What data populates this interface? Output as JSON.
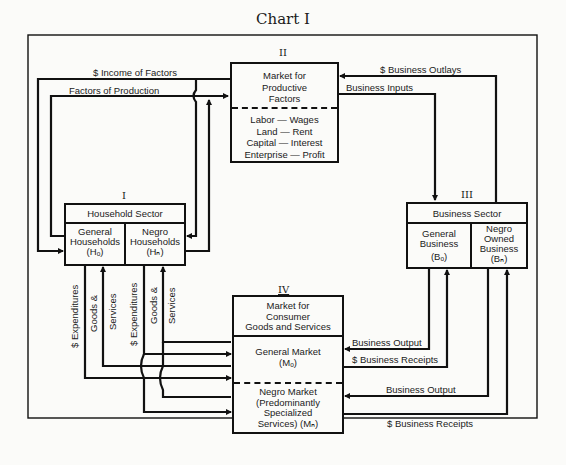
{
  "title": "Chart I",
  "sectors": {
    "market_productive": {
      "numeral": "II",
      "title_lines": [
        "Market for",
        "Productive",
        "Factors"
      ],
      "factor_rows": [
        "Labor — Wages",
        "Land — Rent",
        "Capital — Interest",
        "Enterprise — Profit"
      ]
    },
    "household": {
      "numeral": "I",
      "title": "Household Sector",
      "general": [
        "General",
        "Households",
        "(Hₒ)"
      ],
      "negro": [
        "Negro",
        "Households",
        "(Hₙ)"
      ]
    },
    "business": {
      "numeral": "III",
      "title": "Business Sector",
      "general": [
        "General",
        "Business",
        "(Bₒ)"
      ],
      "negro": [
        "Negro",
        "Owned",
        "Business",
        "(Bₙ)"
      ]
    },
    "market_consumer": {
      "numeral": "IV",
      "title_lines": [
        "Market for",
        "Consumer",
        "Goods and Services"
      ],
      "general": [
        "General Market",
        "(Mₒ)"
      ],
      "negro": [
        "Negro Market",
        "(Predominantly",
        "Specialized",
        "Services) (Mₙ)"
      ]
    }
  },
  "flows": {
    "income_of_factors": "$ Income of Factors",
    "factors_of_production": "Factors of Production",
    "business_outlays": "$ Business Outlays",
    "business_inputs": "Business Inputs",
    "expenditures_general": "$ Expenditures",
    "goods_services_general": [
      "Goods &",
      "Services"
    ],
    "expenditures_negro": "$ Expenditures",
    "goods_services_negro": [
      "Goods &",
      "Services"
    ],
    "business_output_general": "Business Output",
    "business_receipts_general": "$ Business Receipts",
    "business_output_negro": "Business  Output",
    "business_receipts_negro": "$ Business Receipts"
  },
  "colors": {
    "line": "#111111",
    "background": "#fbfbf9"
  }
}
